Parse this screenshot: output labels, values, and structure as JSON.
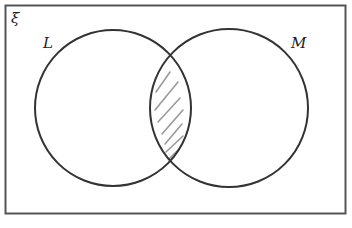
{
  "diagram": {
    "type": "venn",
    "universal_set": {
      "symbol": "ξ"
    },
    "sets": [
      {
        "label": "L",
        "cx": 113,
        "cy": 108,
        "r": 78
      },
      {
        "label": "M",
        "cx": 229,
        "cy": 108,
        "r": 79
      }
    ],
    "shaded_region": "L ∩ M",
    "colors": {
      "outline": "#333333",
      "frame": "#555555",
      "hatch": "#9a9a9a",
      "background": "#ffffff"
    }
  }
}
